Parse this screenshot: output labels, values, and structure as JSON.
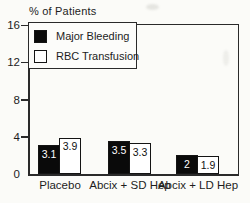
{
  "chart_data": {
    "type": "bar",
    "title": "% of Patients",
    "ylabel": "% of Patients",
    "xlabel": "",
    "categories": [
      "Placebo",
      "Abcix + SD Hep",
      "Abcix + LD Hep"
    ],
    "series": [
      {
        "name": "Major Bleeding",
        "swatch_color": "#0a0a0a",
        "label_text_color": "#ffffff",
        "values": [
          3.1,
          3.5,
          2
        ],
        "labels": [
          "3.1",
          "3.5",
          "2"
        ]
      },
      {
        "name": "RBC Transfusion",
        "swatch_color": "#ffffff",
        "label_text_color": "#111111",
        "values": [
          3.9,
          3.3,
          1.9
        ],
        "labels": [
          "3.9",
          "3.3",
          "1.9"
        ]
      }
    ],
    "ylim": [
      0,
      16
    ],
    "yticks": [
      0,
      4,
      8,
      12,
      16
    ],
    "legend_position": "top-left",
    "grid": false
  }
}
